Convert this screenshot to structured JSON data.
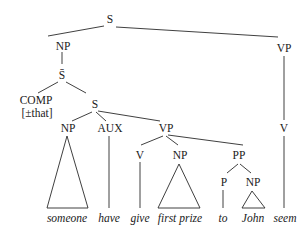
{
  "diagram": {
    "type": "syntax-tree",
    "nodes": {
      "root": "S",
      "subject_np": "NP",
      "sbar": "S̄",
      "comp": "COMP",
      "comp_feature": "[±that]",
      "embedded_s": "S",
      "embedded_np": "NP",
      "aux": "AUX",
      "embedded_vp": "VP",
      "embedded_v": "V",
      "object_np": "NP",
      "pp": "PP",
      "p": "P",
      "pp_np": "NP",
      "matrix_vp": "VP",
      "matrix_v": "V"
    },
    "leaves": {
      "someone": "someone",
      "have": "have",
      "give": "give",
      "first_prize": "first prize",
      "to": "to",
      "john": "John",
      "seem": "seem"
    }
  }
}
